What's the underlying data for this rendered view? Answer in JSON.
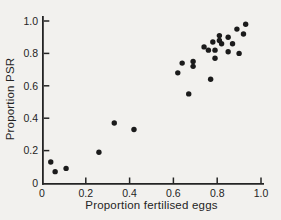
{
  "figure": {
    "background_color": "#f2f1ee",
    "ink_color": "#242424"
  },
  "chart_data": {
    "type": "scatter",
    "title": "",
    "xlabel": "Proportion fertilised eggs",
    "ylabel": "Proportion PSR",
    "xlim": [
      0,
      1.0
    ],
    "ylim": [
      0,
      1.0
    ],
    "x_ticks": [
      0,
      0.2,
      0.4,
      0.6,
      0.8,
      1.0
    ],
    "y_ticks": [
      0,
      0.2,
      0.4,
      0.6,
      0.8,
      1.0
    ],
    "x_tick_labels": [
      "0",
      "0.2",
      "0.4",
      "0.6",
      "0.8",
      "1.0"
    ],
    "y_tick_labels": [
      "0",
      "0.2",
      "0.4",
      "0.6",
      "0.8",
      "1.0"
    ],
    "grid": false,
    "legend": null,
    "marker": {
      "shape": "circle",
      "color": "#1b1b1b",
      "radius_px": 2.7
    },
    "points": [
      [
        0.04,
        0.13
      ],
      [
        0.06,
        0.07
      ],
      [
        0.11,
        0.09
      ],
      [
        0.26,
        0.19
      ],
      [
        0.33,
        0.37
      ],
      [
        0.42,
        0.33
      ],
      [
        0.62,
        0.68
      ],
      [
        0.64,
        0.74
      ],
      [
        0.67,
        0.55
      ],
      [
        0.69,
        0.75
      ],
      [
        0.69,
        0.72
      ],
      [
        0.77,
        0.64
      ],
      [
        0.74,
        0.84
      ],
      [
        0.76,
        0.82
      ],
      [
        0.78,
        0.87
      ],
      [
        0.79,
        0.82
      ],
      [
        0.79,
        0.77
      ],
      [
        0.81,
        0.91
      ],
      [
        0.81,
        0.88
      ],
      [
        0.82,
        0.86
      ],
      [
        0.85,
        0.81
      ],
      [
        0.85,
        0.9
      ],
      [
        0.87,
        0.86
      ],
      [
        0.89,
        0.95
      ],
      [
        0.9,
        0.8
      ],
      [
        0.92,
        0.92
      ],
      [
        0.93,
        0.98
      ]
    ]
  }
}
